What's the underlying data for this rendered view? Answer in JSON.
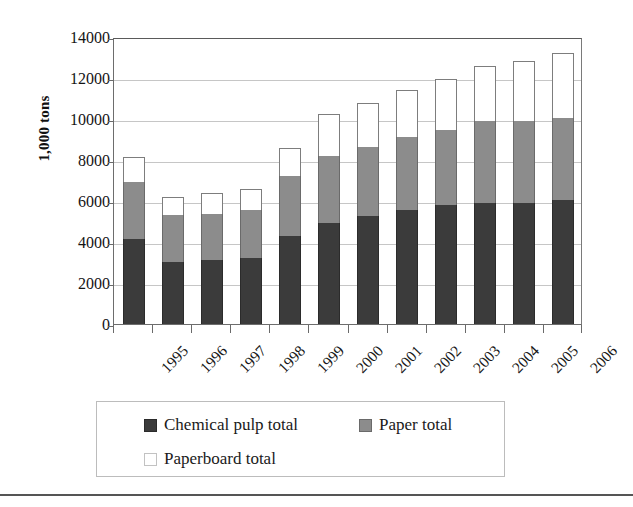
{
  "chart_data": {
    "type": "bar",
    "stacked": true,
    "title": "",
    "xlabel": "",
    "ylabel": "1,000 tons",
    "ylim": [
      0,
      14000
    ],
    "ytick_step": 2000,
    "yticks": [
      "14000",
      "12000",
      "10000",
      "8000",
      "6000",
      "4000",
      "2000",
      "0"
    ],
    "ytick_values": [
      14000,
      12000,
      10000,
      8000,
      6000,
      4000,
      2000,
      0
    ],
    "grid": true,
    "grid_axis": "y",
    "legend_position": "bottom",
    "categories": [
      "1995",
      "1996",
      "1997",
      "1998",
      "1999",
      "2000",
      "2001",
      "2002",
      "2003",
      "2004",
      "2005",
      "2006"
    ],
    "series": [
      {
        "name": "Chemical pulp total",
        "color": "#3b3b3b",
        "values": [
          4150,
          3030,
          3120,
          3220,
          4290,
          4930,
          5270,
          5560,
          5800,
          5900,
          5900,
          6050
        ]
      },
      {
        "name": "Paper total",
        "color": "#8c8c8c",
        "values": [
          2780,
          2290,
          2270,
          2340,
          2930,
          3270,
          3370,
          3560,
          3660,
          4000,
          4000,
          4000
        ]
      },
      {
        "name": "Paperboard total",
        "color": "#ffffff",
        "values": [
          1220,
          880,
          1010,
          1030,
          1360,
          2040,
          2140,
          2290,
          2490,
          2690,
          2930,
          3170
        ]
      }
    ],
    "totals": [
      8150,
      6200,
      6400,
      6590,
      8580,
      10240,
      10780,
      11410,
      11950,
      12590,
      12830,
      13220
    ]
  },
  "legend": {
    "entries": [
      {
        "label": "Chemical pulp total",
        "swatch": "swatch-chemical",
        "swatch_name": "legend-swatch-chemical-pulp"
      },
      {
        "label": "Paper total",
        "swatch": "swatch-paper",
        "swatch_name": "legend-swatch-paper"
      },
      {
        "label": "Paperboard total",
        "swatch": "swatch-paperboard",
        "swatch_name": "legend-swatch-paperboard"
      }
    ]
  },
  "colors": {
    "chemical_pulp": "#3b3b3b",
    "paper": "#8c8c8c",
    "paperboard": "#ffffff",
    "gridline": "#c6c6c6",
    "axis": "#6d6d6d",
    "text": "#141414"
  }
}
